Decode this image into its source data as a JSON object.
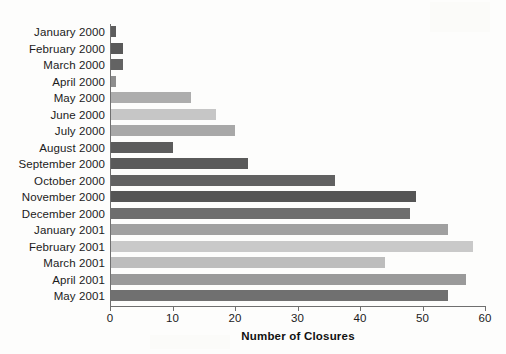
{
  "chart_data": {
    "type": "bar",
    "orientation": "horizontal",
    "title": "",
    "xlabel": "Number of Closures",
    "ylabel": "",
    "xlim": [
      0,
      60
    ],
    "xticks": [
      0,
      10,
      20,
      30,
      40,
      50,
      60
    ],
    "xtick_labels": [
      "0",
      "10",
      "20",
      "30",
      "40",
      "50",
      "60"
    ],
    "grid": false,
    "legend": "none",
    "categories": [
      "January 2000",
      "February 2000",
      "March 2000",
      "April 2000",
      "May 2000",
      "June 2000",
      "July 2000",
      "August 2000",
      "September 2000",
      "October 2000",
      "November 2000",
      "December 2000",
      "January 2001",
      "February 2001",
      "March 2001",
      "April 2001",
      "May 2001"
    ],
    "values": [
      1,
      2,
      2,
      1,
      13,
      17,
      20,
      10,
      22,
      36,
      49,
      48,
      54,
      58,
      44,
      57,
      54
    ],
    "bar_colors": [
      "#5d5d5d",
      "#595959",
      "#636363",
      "#8e8e8e",
      "#adadad",
      "#c6c6c6",
      "#a8a8a8",
      "#5c5c5c",
      "#5a5a5a",
      "#616161",
      "#555555",
      "#6e6e6e",
      "#a0a0a0",
      "#c9c9c9",
      "#bdbdbd",
      "#9a9a9a",
      "#707070"
    ],
    "axis_color": "#6f6f6f",
    "background_color": "#fdfdfc",
    "text_color": "#1b1b1b"
  }
}
